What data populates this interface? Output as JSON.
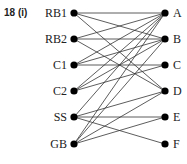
{
  "title": "18 (i)",
  "left_nodes": [
    {
      "id": "RB1",
      "y": 13
    },
    {
      "id": "RB2",
      "y": 39
    },
    {
      "id": "C1",
      "y": 65
    },
    {
      "id": "C2",
      "y": 91
    },
    {
      "id": "SS",
      "y": 117
    },
    {
      "id": "GB",
      "y": 144
    }
  ],
  "right_nodes": [
    {
      "id": "A",
      "y": 13
    },
    {
      "id": "B",
      "y": 39
    },
    {
      "id": "C",
      "y": 65
    },
    {
      "id": "D",
      "y": 91
    },
    {
      "id": "E",
      "y": 117
    },
    {
      "id": "F",
      "y": 144
    }
  ],
  "edges": [
    [
      "RB1",
      "A"
    ],
    [
      "RB1",
      "B"
    ],
    [
      "RB1",
      "D"
    ],
    [
      "RB2",
      "A"
    ],
    [
      "RB2",
      "B"
    ],
    [
      "RB2",
      "D"
    ],
    [
      "C1",
      "A"
    ],
    [
      "C1",
      "B"
    ],
    [
      "C1",
      "C"
    ],
    [
      "C2",
      "A"
    ],
    [
      "C2",
      "B"
    ],
    [
      "C2",
      "C"
    ],
    [
      "SS",
      "A"
    ],
    [
      "SS",
      "D"
    ],
    [
      "SS",
      "E"
    ],
    [
      "SS",
      "F"
    ],
    [
      "GB",
      "A"
    ],
    [
      "GB",
      "B"
    ],
    [
      "GB",
      "D"
    ],
    [
      "GB",
      "E"
    ]
  ]
}
